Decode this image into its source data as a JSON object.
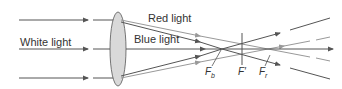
{
  "diagram": {
    "labels": {
      "white_light": "White light",
      "red_light": "Red light",
      "blue_light": "Blue light"
    },
    "focal_points": [
      {
        "symbol": "F",
        "sub": "b",
        "meaning": "blue focus"
      },
      {
        "symbol": "F′",
        "sub": "",
        "meaning": "intermediate focus"
      },
      {
        "symbol": "F",
        "sub": "r",
        "meaning": "red focus"
      }
    ],
    "colors": {
      "blue_ray": "#555555",
      "red_ray": "#999999",
      "lens_fill": "#d9d9d9",
      "lens_stroke": "#555555"
    }
  }
}
